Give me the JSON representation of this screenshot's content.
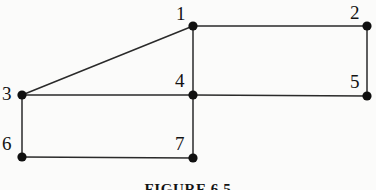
{
  "figure": {
    "caption": "FIGURE 6.5",
    "caption_top": 181,
    "background_color": "#fbfbfa",
    "edge_color": "#2a2a2a",
    "node_color": "#101010",
    "label_color": "#131313",
    "node_radius": 4.6,
    "edge_width": 1.5
  },
  "chart_data": {
    "type": "diagram",
    "title": "FIGURE 6.5",
    "nodes": [
      {
        "id": "1",
        "label": "1",
        "x": 193,
        "y": 26,
        "label_x": 176,
        "label_y": 4
      },
      {
        "id": "2",
        "label": "2",
        "x": 367,
        "y": 26,
        "label_x": 350,
        "label_y": 3
      },
      {
        "id": "3",
        "label": "3",
        "x": 22,
        "y": 95,
        "label_x": 2,
        "label_y": 84
      },
      {
        "id": "4",
        "label": "4",
        "x": 193,
        "y": 95,
        "label_x": 175,
        "label_y": 71
      },
      {
        "id": "5",
        "label": "5",
        "x": 367,
        "y": 96,
        "label_x": 350,
        "label_y": 72
      },
      {
        "id": "6",
        "label": "6",
        "x": 22,
        "y": 157,
        "label_x": 2,
        "label_y": 134
      },
      {
        "id": "7",
        "label": "7",
        "x": 193,
        "y": 158,
        "label_x": 175,
        "label_y": 134
      }
    ],
    "edges": [
      {
        "from": "3",
        "to": "1"
      },
      {
        "from": "1",
        "to": "2"
      },
      {
        "from": "2",
        "to": "5"
      },
      {
        "from": "5",
        "to": "4"
      },
      {
        "from": "4",
        "to": "1"
      },
      {
        "from": "3",
        "to": "4"
      },
      {
        "from": "3",
        "to": "6"
      },
      {
        "from": "6",
        "to": "7"
      },
      {
        "from": "7",
        "to": "4"
      }
    ],
    "xlabel": "",
    "ylabel": "",
    "grid": false,
    "legend": null
  }
}
